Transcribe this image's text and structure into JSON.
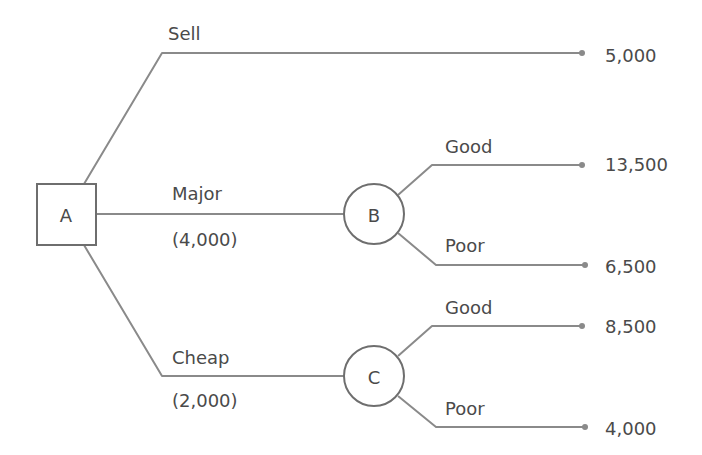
{
  "diagram": {
    "type": "decision-tree",
    "colors": {
      "line": "#8a8a8a",
      "node_border": "#6e6e6e",
      "text": "#4a4a4a",
      "background": "#ffffff"
    },
    "nodes": {
      "A": {
        "label": "A",
        "shape": "square",
        "kind": "decision"
      },
      "B": {
        "label": "B",
        "shape": "circle",
        "kind": "chance"
      },
      "C": {
        "label": "C",
        "shape": "circle",
        "kind": "chance"
      }
    },
    "branches": {
      "sell": {
        "label": "Sell",
        "cost": "",
        "from": "A",
        "payoff": "5,000"
      },
      "major": {
        "label": "Major",
        "cost": "(4,000)",
        "from": "A",
        "to": "B"
      },
      "cheap": {
        "label": "Cheap",
        "cost": "(2,000)",
        "from": "A",
        "to": "C"
      },
      "b_good": {
        "label": "Good",
        "from": "B",
        "payoff": "13,500"
      },
      "b_poor": {
        "label": "Poor",
        "from": "B",
        "payoff": "6,500"
      },
      "c_good": {
        "label": "Good",
        "from": "C",
        "payoff": "8,500"
      },
      "c_poor": {
        "label": "Poor",
        "from": "C",
        "payoff": "4,000"
      }
    }
  }
}
